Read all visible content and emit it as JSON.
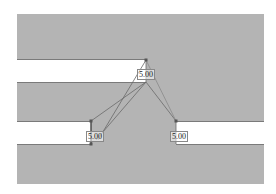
{
  "diagram": {
    "colors": {
      "material": "#b4b4b4",
      "slot": "#ffffff",
      "edge": "#7a7a7a",
      "dimension_line": "#6a6a6a"
    },
    "slots": [
      {
        "id": "upper-left-slot"
      },
      {
        "id": "lower-left-slot"
      },
      {
        "id": "lower-right-slot"
      }
    ],
    "dimension_labels": [
      {
        "id": "upper-vertex-label",
        "text": "5.00"
      },
      {
        "id": "lower-left-label",
        "text": "5.00"
      },
      {
        "id": "lower-right-label",
        "text": "5.00"
      }
    ]
  }
}
